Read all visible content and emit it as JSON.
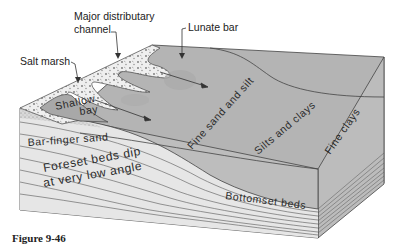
{
  "figure": {
    "caption": "Figure 9-46",
    "type": "block diagram of a delta",
    "callout_labels": {
      "major_channel_line1": "Major distributary",
      "major_channel_line2": "channel",
      "lunate_bar": "Lunate bar",
      "salt_marsh": "Salt marsh"
    },
    "zone_labels": {
      "shallow_bay_line1": "Shallow",
      "shallow_bay_line2": "bay",
      "bar_finger_sand": "Bar-finger sand",
      "foreset_line1": "Foreset beds dip",
      "foreset_line2": "at very low angle",
      "fine_sand_silt": "Fine sand and silt",
      "silts_clays": "Silts and clays",
      "fine_clays": "Fine clays",
      "bottomset_beds": "Bottomset beds"
    },
    "colors": {
      "top_surface": "#b4b4b4",
      "front_face": "#bdbdbd",
      "foreset_beds": "#e6e6e6",
      "marsh": "#efefef",
      "lines": "#444444"
    }
  }
}
